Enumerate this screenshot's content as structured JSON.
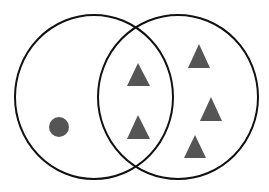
{
  "diagram": {
    "type": "venn",
    "background": "#ffffff",
    "stroke_color": "#111111",
    "fill_color": "#555555",
    "sets": [
      {
        "name": "left-set",
        "cx": 94,
        "cy": 97,
        "rx": 79,
        "ry": 82
      },
      {
        "name": "right-set",
        "cx": 178,
        "cy": 97,
        "rx": 80,
        "ry": 82
      }
    ],
    "items": [
      {
        "shape": "circle",
        "region": "left-only",
        "cx": 59,
        "cy": 127,
        "r": 10
      },
      {
        "shape": "triangle",
        "region": "intersection",
        "points": "138,63 127,86 150,86"
      },
      {
        "shape": "triangle",
        "region": "intersection",
        "points": "138,115 127,139 150,139"
      },
      {
        "shape": "triangle",
        "region": "right-only",
        "points": "199,44 188,68 210,68"
      },
      {
        "shape": "triangle",
        "region": "right-only",
        "points": "211,97 200,121 222,121"
      },
      {
        "shape": "triangle",
        "region": "right-only",
        "points": "195,135 184,158 206,158"
      }
    ]
  }
}
